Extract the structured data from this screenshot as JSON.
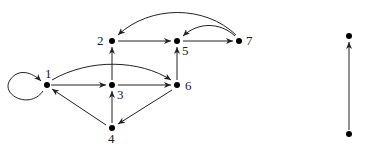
{
  "graphs": [
    {
      "id": "left-graph",
      "nodes": [
        {
          "id": "1",
          "label": "1",
          "x": 47,
          "y": 85,
          "lx": 50,
          "ly": 78
        },
        {
          "id": "2",
          "label": "2",
          "x": 112,
          "y": 41,
          "lx": 98,
          "ly": 45
        },
        {
          "id": "3",
          "label": "3",
          "x": 112,
          "y": 85,
          "lx": 117,
          "ly": 99
        },
        {
          "id": "4",
          "label": "4",
          "x": 112,
          "y": 128,
          "lx": 107,
          "ly": 143
        },
        {
          "id": "5",
          "label": "5",
          "x": 177,
          "y": 41,
          "lx": 182,
          "ly": 55
        },
        {
          "id": "6",
          "label": "6",
          "x": 177,
          "y": 85,
          "lx": 185,
          "ly": 90
        },
        {
          "id": "7",
          "label": "7",
          "x": 239,
          "y": 41,
          "lx": 246,
          "ly": 45
        }
      ],
      "edges": [
        {
          "from": "1",
          "to": "1",
          "type": "self-loop"
        },
        {
          "from": "1",
          "to": "3"
        },
        {
          "from": "1",
          "to": "6",
          "type": "curved"
        },
        {
          "from": "2",
          "to": "5"
        },
        {
          "from": "3",
          "to": "2"
        },
        {
          "from": "3",
          "to": "6"
        },
        {
          "from": "4",
          "to": "1"
        },
        {
          "from": "4",
          "to": "3"
        },
        {
          "from": "5",
          "to": "7"
        },
        {
          "from": "6",
          "to": "4"
        },
        {
          "from": "6",
          "to": "5"
        },
        {
          "from": "7",
          "to": "2",
          "type": "curved"
        },
        {
          "from": "7",
          "to": "5",
          "type": "curved"
        }
      ]
    },
    {
      "id": "right-graph",
      "nodes": [
        {
          "id": "a",
          "label": "",
          "x": 349,
          "y": 36
        },
        {
          "id": "b",
          "label": "",
          "x": 349,
          "y": 134
        }
      ],
      "edges": [
        {
          "from": "b",
          "to": "a"
        }
      ]
    }
  ]
}
